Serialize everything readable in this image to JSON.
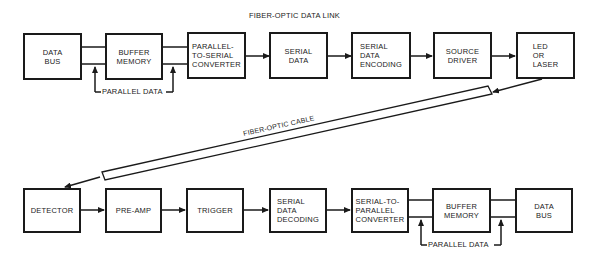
{
  "diagram": {
    "title": "FIBER-OPTIC DATA LINK",
    "cable_label": "FIBER-OPTIC CABLE",
    "transmitter": {
      "blocks": [
        {
          "id": "tx-data-bus",
          "label": "DATA\nBUS"
        },
        {
          "id": "tx-buffer-memory",
          "label": "BUFFER\nMEMORY"
        },
        {
          "id": "parallel-to-serial-converter",
          "label": "PARALLEL-\nTO-SERIAL\nCONVERTER"
        },
        {
          "id": "serial-data",
          "label": "SERIAL\nDATA"
        },
        {
          "id": "serial-data-encoding",
          "label": "SERIAL\nDATA\nENCODING"
        },
        {
          "id": "source-driver",
          "label": "SOURCE\nDRIVER"
        },
        {
          "id": "led-or-laser",
          "label": "LED\nOR\nLASER"
        }
      ],
      "parallel_data_label": "PARALLEL DATA"
    },
    "receiver": {
      "blocks": [
        {
          "id": "detector",
          "label": "DETECTOR"
        },
        {
          "id": "pre-amp",
          "label": "PRE-AMP"
        },
        {
          "id": "trigger",
          "label": "TRIGGER"
        },
        {
          "id": "serial-data-decoding",
          "label": "SERIAL\nDATA\nDECODING"
        },
        {
          "id": "serial-to-parallel-converter",
          "label": "SERIAL-TO-\nPARALLEL\nCONVERTER"
        },
        {
          "id": "rx-buffer-memory",
          "label": "BUFFER\nMEMORY"
        },
        {
          "id": "rx-data-bus",
          "label": "DATA\nBUS"
        }
      ],
      "parallel_data_label": "PARALLEL DATA"
    },
    "colors": {
      "line": "#1a1a1a",
      "background": "#ffffff"
    }
  }
}
